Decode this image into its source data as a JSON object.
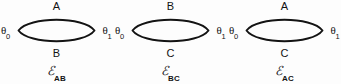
{
  "figure": {
    "type": "diagram",
    "background_color": "#fdfdfd",
    "stroke_color": "#131313",
    "text_color": "#131313"
  },
  "diagrams": [
    {
      "id": "E_AB",
      "top_edge_label": "A",
      "bottom_edge_label": "B",
      "left_vertex_symbol": "θ",
      "left_vertex_subscript": "0",
      "right_vertex_symbol": "θ",
      "right_vertex_subscript": "1",
      "caption_symbol": "ℰ",
      "caption_subscript": "AB"
    },
    {
      "id": "E_BC",
      "top_edge_label": "B",
      "bottom_edge_label": "C",
      "left_vertex_symbol": "θ",
      "left_vertex_subscript": "0",
      "right_vertex_symbol": "θ",
      "right_vertex_subscript": "1",
      "caption_symbol": "ℰ",
      "caption_subscript": "BC"
    },
    {
      "id": "E_AC",
      "top_edge_label": "A",
      "bottom_edge_label": "C",
      "left_vertex_symbol": "θ",
      "left_vertex_subscript": "0",
      "right_vertex_symbol": "θ",
      "right_vertex_subscript": "1",
      "caption_symbol": "ℰ",
      "caption_subscript": "AC"
    }
  ]
}
